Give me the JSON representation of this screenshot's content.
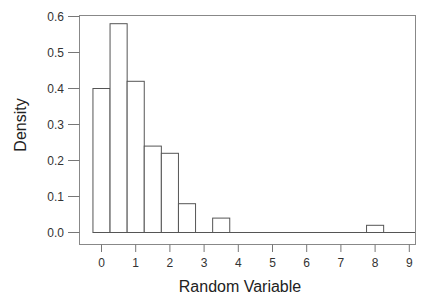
{
  "chart_data": {
    "type": "bar",
    "subtype": "histogram",
    "title": "",
    "xlabel": "Random Variable",
    "ylabel": "Density",
    "xlim": [
      -0.5,
      9.1
    ],
    "ylim": [
      0.0,
      0.6
    ],
    "xticks": [
      "0",
      "1",
      "2",
      "3",
      "4",
      "5",
      "6",
      "7",
      "8",
      "9"
    ],
    "yticks": [
      "0.0",
      "0.1",
      "0.2",
      "0.3",
      "0.4",
      "0.5",
      "0.6"
    ],
    "bin_width": 0.5,
    "bins": [
      {
        "start": -0.25,
        "end": 0.25,
        "value": 0.4
      },
      {
        "start": 0.25,
        "end": 0.75,
        "value": 0.58
      },
      {
        "start": 0.75,
        "end": 1.25,
        "value": 0.42
      },
      {
        "start": 1.25,
        "end": 1.75,
        "value": 0.24
      },
      {
        "start": 1.75,
        "end": 2.25,
        "value": 0.22
      },
      {
        "start": 2.25,
        "end": 2.75,
        "value": 0.08
      },
      {
        "start": 2.75,
        "end": 3.25,
        "value": 0.0
      },
      {
        "start": 3.25,
        "end": 3.75,
        "value": 0.04
      },
      {
        "start": 3.75,
        "end": 7.75,
        "value": 0.0
      },
      {
        "start": 7.75,
        "end": 8.25,
        "value": 0.02
      }
    ],
    "grid": false,
    "legend": null,
    "colors": {
      "bar_fill": "#ffffff",
      "bar_stroke": "#555555",
      "frame": "#777777"
    }
  }
}
